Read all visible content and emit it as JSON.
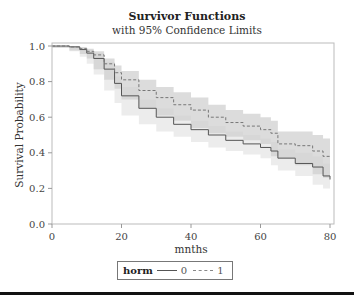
{
  "chart_data": {
    "type": "line",
    "title": "Survivor Functions",
    "subtitle": "with 95% Confidence Limits",
    "xlabel": "mnths",
    "ylabel": "Survival Probability",
    "xlim": [
      0,
      80
    ],
    "ylim": [
      0.0,
      1.0
    ],
    "x_ticks": [
      "0",
      "20",
      "40",
      "60",
      "80"
    ],
    "y_ticks": [
      "0.0",
      "0.2",
      "0.4",
      "0.6",
      "0.8",
      "1.0"
    ],
    "grid": false,
    "legend_position": "bottom",
    "legend_title": "horm",
    "x": [
      0,
      5,
      8,
      10,
      12,
      15,
      18,
      20,
      25,
      30,
      35,
      40,
      45,
      50,
      55,
      60,
      63,
      65,
      70,
      75,
      78,
      80
    ],
    "series": [
      {
        "name": "0",
        "style": "solid",
        "color": "#555555",
        "values": [
          1.0,
          0.995,
          0.98,
          0.96,
          0.93,
          0.87,
          0.79,
          0.72,
          0.65,
          0.6,
          0.56,
          0.53,
          0.5,
          0.47,
          0.45,
          0.43,
          0.41,
          0.37,
          0.34,
          0.32,
          0.27,
          0.25
        ],
        "ci_lower": [
          1.0,
          0.99,
          0.97,
          0.94,
          0.9,
          0.84,
          0.75,
          0.68,
          0.61,
          0.56,
          0.52,
          0.49,
          0.46,
          0.43,
          0.41,
          0.39,
          0.37,
          0.33,
          0.3,
          0.27,
          0.22,
          0.2
        ],
        "ci_upper": [
          1.0,
          1.0,
          0.99,
          0.98,
          0.96,
          0.91,
          0.83,
          0.77,
          0.7,
          0.65,
          0.61,
          0.58,
          0.55,
          0.52,
          0.5,
          0.48,
          0.46,
          0.42,
          0.4,
          0.38,
          0.34,
          0.31
        ]
      },
      {
        "name": "1",
        "style": "dashed",
        "color": "#777777",
        "values": [
          1.0,
          0.995,
          0.985,
          0.97,
          0.95,
          0.9,
          0.85,
          0.81,
          0.75,
          0.71,
          0.67,
          0.64,
          0.6,
          0.57,
          0.55,
          0.53,
          0.51,
          0.45,
          0.44,
          0.41,
          0.38,
          0.38
        ],
        "ci_lower": [
          1.0,
          0.99,
          0.975,
          0.955,
          0.93,
          0.87,
          0.81,
          0.76,
          0.7,
          0.65,
          0.61,
          0.58,
          0.54,
          0.51,
          0.49,
          0.47,
          0.45,
          0.38,
          0.37,
          0.33,
          0.28,
          0.26
        ],
        "ci_upper": [
          1.0,
          1.0,
          0.995,
          0.985,
          0.97,
          0.93,
          0.89,
          0.86,
          0.81,
          0.77,
          0.74,
          0.71,
          0.67,
          0.64,
          0.62,
          0.6,
          0.58,
          0.52,
          0.52,
          0.5,
          0.48,
          0.48
        ]
      }
    ]
  },
  "legend": {
    "title": "horm",
    "items": [
      {
        "label": "0",
        "style": "solid"
      },
      {
        "label": "1",
        "style": "dashed"
      }
    ]
  }
}
